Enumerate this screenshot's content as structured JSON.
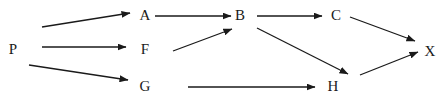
{
  "diagram": {
    "type": "directed-graph",
    "colors": {
      "stroke": "#1a1a1a",
      "text": "#1a1a1a",
      "background": "#ffffff"
    },
    "nodes": [
      {
        "id": "P",
        "label": "P",
        "x": 13,
        "y": 49
      },
      {
        "id": "A",
        "label": "A",
        "x": 145,
        "y": 15
      },
      {
        "id": "F",
        "label": "F",
        "x": 145,
        "y": 49
      },
      {
        "id": "G",
        "label": "G",
        "x": 145,
        "y": 86
      },
      {
        "id": "B",
        "label": "B",
        "x": 240,
        "y": 15
      },
      {
        "id": "C",
        "label": "C",
        "x": 336,
        "y": 15
      },
      {
        "id": "H",
        "label": "H",
        "x": 333,
        "y": 86
      },
      {
        "id": "X",
        "label": "X",
        "x": 430,
        "y": 51
      }
    ],
    "edges": [
      {
        "from": "P",
        "to": "A",
        "x1": 42,
        "y1": 27,
        "x2": 130,
        "y2": 13
      },
      {
        "from": "P",
        "to": "F",
        "x1": 42,
        "y1": 47,
        "x2": 126,
        "y2": 47
      },
      {
        "from": "P",
        "to": "G",
        "x1": 29,
        "y1": 65,
        "x2": 128,
        "y2": 80
      },
      {
        "from": "A",
        "to": "B",
        "x1": 155,
        "y1": 16,
        "x2": 231,
        "y2": 16
      },
      {
        "from": "F",
        "to": "B",
        "x1": 173,
        "y1": 51,
        "x2": 232,
        "y2": 29
      },
      {
        "from": "B",
        "to": "C",
        "x1": 257,
        "y1": 16,
        "x2": 322,
        "y2": 16
      },
      {
        "from": "B",
        "to": "H",
        "x1": 257,
        "y1": 28,
        "x2": 348,
        "y2": 74
      },
      {
        "from": "C",
        "to": "X",
        "x1": 350,
        "y1": 17,
        "x2": 415,
        "y2": 41
      },
      {
        "from": "G",
        "to": "H",
        "x1": 188,
        "y1": 87,
        "x2": 315,
        "y2": 87
      },
      {
        "from": "H",
        "to": "X",
        "x1": 360,
        "y1": 75,
        "x2": 418,
        "y2": 52
      }
    ]
  }
}
